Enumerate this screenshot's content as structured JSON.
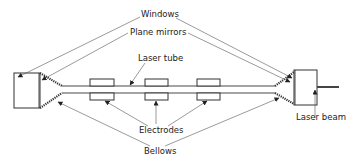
{
  "diagram": {
    "labels": {
      "windows": "Windows",
      "plane_mirrors": "Plane mirrors",
      "laser_tube": "Laser tube",
      "electrodes": "Electrodes",
      "bellows": "Bellows",
      "laser_beam": "Laser beam"
    },
    "components": [
      {
        "name": "left-mirror-housing",
        "type": "box"
      },
      {
        "name": "right-mirror-housing",
        "type": "box"
      },
      {
        "name": "laser-tube",
        "type": "tube"
      },
      {
        "name": "electrode-1",
        "type": "electrode-pair"
      },
      {
        "name": "electrode-2",
        "type": "electrode-pair"
      },
      {
        "name": "electrode-3",
        "type": "electrode-pair"
      },
      {
        "name": "left-bellows",
        "type": "bellows"
      },
      {
        "name": "right-bellows",
        "type": "bellows"
      },
      {
        "name": "output-beam",
        "type": "beam"
      }
    ],
    "colors": {
      "line": "#333333",
      "text": "#222222",
      "background": "#ffffff"
    }
  }
}
